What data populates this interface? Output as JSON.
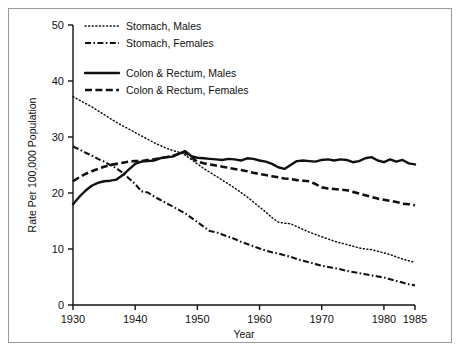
{
  "figure": {
    "background_color": "#ffffff",
    "border_color": "#9a9a9a",
    "line_color": "#111111"
  },
  "axes": {
    "y_axis_title": "Rate Per 100,000 Population",
    "x_axis_title": "Year",
    "y_ticks": [
      "0",
      "10",
      "20",
      "30",
      "40",
      "50"
    ],
    "x_ticks": [
      "1930",
      "1940",
      "1950",
      "1960",
      "1970",
      "1980",
      "1985"
    ]
  },
  "legend": {
    "items": [
      {
        "label": "Stomach, Males",
        "style": "dotted"
      },
      {
        "label": "Stomach, Females",
        "style": "dash-dot"
      },
      {
        "label": "Colon & Rectum, Males",
        "style": "solid"
      },
      {
        "label": "Colon & Rectum, Females",
        "style": "dashed"
      }
    ]
  },
  "chart_data": {
    "type": "line",
    "title": "",
    "subtitle": "",
    "xlabel": "Year",
    "ylabel": "Rate Per 100,000 Population",
    "xlim": [
      1930,
      1985
    ],
    "ylim": [
      0,
      50
    ],
    "grid": false,
    "legend_position": "top-left",
    "x": [
      1930,
      1931,
      1932,
      1933,
      1934,
      1935,
      1936,
      1937,
      1938,
      1939,
      1940,
      1941,
      1942,
      1943,
      1944,
      1945,
      1946,
      1947,
      1948,
      1949,
      1950,
      1951,
      1952,
      1953,
      1954,
      1955,
      1956,
      1957,
      1958,
      1959,
      1960,
      1961,
      1962,
      1963,
      1964,
      1965,
      1966,
      1967,
      1968,
      1969,
      1970,
      1971,
      1972,
      1973,
      1974,
      1975,
      1976,
      1977,
      1978,
      1979,
      1980,
      1981,
      1982,
      1983,
      1984,
      1985
    ],
    "series": [
      {
        "name": "Stomach, Males",
        "style": "dotted",
        "values": [
          37.2,
          36.6,
          36.0,
          35.4,
          34.7,
          34.0,
          33.3,
          32.6,
          32.0,
          31.4,
          30.8,
          30.2,
          29.6,
          29.0,
          28.5,
          28.0,
          27.6,
          27.3,
          26.8,
          26.0,
          25.2,
          24.4,
          23.7,
          23.0,
          22.3,
          21.6,
          20.9,
          20.1,
          19.3,
          18.4,
          17.5,
          16.6,
          15.6,
          14.8,
          14.6,
          14.5,
          14.0,
          13.5,
          13.0,
          12.6,
          12.2,
          11.8,
          11.4,
          11.1,
          10.8,
          10.5,
          10.2,
          10.0,
          9.9,
          9.6,
          9.3,
          9.0,
          8.6,
          8.2,
          7.9,
          7.6
        ]
      },
      {
        "name": "Stomach, Females",
        "style": "dash-dot",
        "values": [
          28.3,
          27.8,
          27.2,
          26.7,
          26.1,
          25.6,
          25.0,
          24.4,
          23.6,
          22.6,
          21.6,
          20.3,
          20.1,
          19.4,
          18.8,
          18.2,
          17.6,
          17.0,
          16.4,
          15.6,
          14.8,
          14.0,
          13.2,
          13.0,
          12.6,
          12.2,
          11.8,
          11.3,
          10.9,
          10.5,
          10.1,
          9.7,
          9.4,
          9.2,
          8.9,
          8.6,
          8.2,
          7.9,
          7.6,
          7.3,
          7.0,
          6.8,
          6.6,
          6.4,
          6.1,
          5.9,
          5.7,
          5.5,
          5.3,
          5.1,
          4.9,
          4.6,
          4.3,
          4.0,
          3.7,
          3.5
        ]
      },
      {
        "name": "Colon & Rectum, Males",
        "style": "solid",
        "values": [
          18.0,
          19.3,
          20.4,
          21.3,
          21.8,
          22.1,
          22.2,
          22.4,
          23.2,
          24.2,
          25.2,
          25.6,
          25.7,
          25.8,
          26.2,
          26.4,
          26.5,
          27.0,
          27.5,
          26.6,
          26.3,
          26.2,
          26.1,
          26.0,
          25.9,
          26.1,
          26.0,
          25.8,
          26.2,
          26.1,
          25.8,
          25.6,
          25.2,
          24.6,
          24.3,
          25.0,
          25.7,
          25.8,
          25.7,
          25.6,
          25.9,
          26.0,
          25.8,
          26.0,
          25.9,
          25.5,
          25.7,
          26.2,
          26.4,
          25.8,
          25.5,
          26.0,
          25.6,
          25.9,
          25.3,
          25.1
        ]
      },
      {
        "name": "Colon & Rectum, Females",
        "style": "dashed",
        "values": [
          22.1,
          22.8,
          23.4,
          23.9,
          24.3,
          24.7,
          25.0,
          25.2,
          25.4,
          25.6,
          25.7,
          25.7,
          25.9,
          26.0,
          26.2,
          26.4,
          26.6,
          27.0,
          27.3,
          26.4,
          25.6,
          25.3,
          25.1,
          24.9,
          24.7,
          24.5,
          24.3,
          24.1,
          23.9,
          23.6,
          23.4,
          23.2,
          23.0,
          22.8,
          22.6,
          22.5,
          22.3,
          22.2,
          22.1,
          21.6,
          21.0,
          20.8,
          20.7,
          20.6,
          20.5,
          20.2,
          19.9,
          19.6,
          19.3,
          19.0,
          18.8,
          18.6,
          18.4,
          18.1,
          18.0,
          17.8
        ]
      }
    ]
  }
}
